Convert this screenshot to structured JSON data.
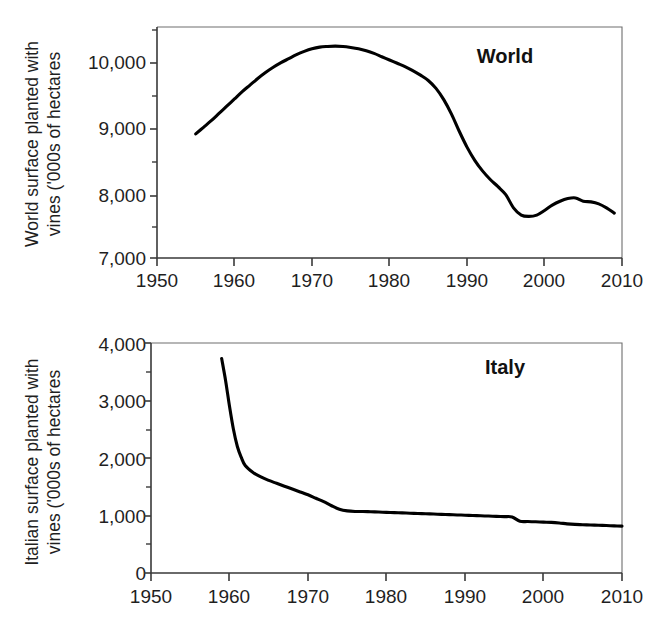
{
  "figure": {
    "background": "#ffffff",
    "line_color": "#000000",
    "axis_color": "#3a3a3a"
  },
  "chart_data": [
    {
      "type": "line",
      "panel_id": "world",
      "title": "",
      "annotation": "World",
      "xlabel": "",
      "ylabel": "World surface planted with vines ('000s of hectares",
      "ylabel_line1": "World surface planted with",
      "ylabel_line2": "vines ('000s of hectares",
      "xlim": [
        1950,
        2010
      ],
      "ylim": [
        7000,
        10500
      ],
      "grid": false,
      "legend": "none",
      "xticks": [
        1950,
        1960,
        1970,
        1980,
        1990,
        2000,
        2010
      ],
      "xtick_labels": [
        "1950",
        "1960",
        "1970",
        "1980",
        "1990",
        "2000",
        "2010"
      ],
      "x_minor_step": 5,
      "yticks": [
        7000,
        8000,
        9000,
        10000
      ],
      "ytick_labels": [
        "7,000",
        "8,000",
        "9,000",
        "10,000"
      ],
      "y_minor_step": 500,
      "series": [
        {
          "name": "World surface planted with vines",
          "units": "'000s of hectares",
          "x": [
            1955,
            1956,
            1957,
            1958,
            1959,
            1960,
            1961,
            1962,
            1963,
            1964,
            1965,
            1966,
            1967,
            1968,
            1969,
            1970,
            1971,
            1972,
            1973,
            1974,
            1975,
            1976,
            1977,
            1978,
            1979,
            1980,
            1981,
            1982,
            1983,
            1984,
            1985,
            1986,
            1987,
            1988,
            1989,
            1990,
            1991,
            1992,
            1993,
            1994,
            1995,
            1996,
            1997,
            1998,
            1999,
            2000,
            2001,
            2002,
            2003,
            2004,
            2005,
            2006,
            2007,
            2008,
            2009
          ],
          "values": [
            8880,
            8980,
            9080,
            9190,
            9300,
            9410,
            9520,
            9620,
            9720,
            9810,
            9890,
            9960,
            10020,
            10080,
            10130,
            10170,
            10195,
            10205,
            10210,
            10205,
            10190,
            10170,
            10140,
            10100,
            10050,
            10000,
            9950,
            9900,
            9840,
            9770,
            9690,
            9570,
            9400,
            9180,
            8920,
            8680,
            8480,
            8320,
            8190,
            8080,
            7960,
            7760,
            7650,
            7630,
            7650,
            7720,
            7800,
            7860,
            7900,
            7910,
            7860,
            7850,
            7820,
            7760,
            7680
          ]
        }
      ]
    },
    {
      "type": "line",
      "panel_id": "italy",
      "title": "",
      "annotation": "Italy",
      "xlabel": "",
      "ylabel": "Italian surface planted with vines ('000s of hectares",
      "ylabel_line1": "Italian surface planted with",
      "ylabel_line2": "vines ('000s of hectares",
      "xlim": [
        1950,
        2010
      ],
      "ylim": [
        0,
        4000
      ],
      "grid": false,
      "legend": "none",
      "xticks": [
        1950,
        1960,
        1970,
        1980,
        1990,
        2000,
        2010
      ],
      "xtick_labels": [
        "1950",
        "1960",
        "1970",
        "1980",
        "1990",
        "2000",
        "2010"
      ],
      "x_minor_step": 5,
      "yticks": [
        0,
        1000,
        2000,
        3000,
        4000
      ],
      "ytick_labels": [
        "0",
        "1,000",
        "2,000",
        "3,000",
        "4,000"
      ],
      "y_minor_step": 500,
      "series": [
        {
          "name": "Italian surface planted with vines",
          "units": "'000s of hectares",
          "x": [
            1959,
            1959.5,
            1960,
            1960.5,
            1961,
            1961.5,
            1962,
            1963,
            1964,
            1965,
            1966,
            1967,
            1968,
            1969,
            1970,
            1971,
            1972,
            1973,
            1974,
            1975,
            1976,
            1977,
            1978,
            1979,
            1980,
            1981,
            1982,
            1983,
            1984,
            1985,
            1986,
            1987,
            1988,
            1989,
            1990,
            1991,
            1992,
            1993,
            1994,
            1995,
            1996,
            1997,
            1998,
            1999,
            2000,
            2001,
            2002,
            2003,
            2004,
            2005,
            2006,
            2007,
            2008,
            2009,
            2010
          ],
          "values": [
            3730,
            3350,
            2900,
            2500,
            2200,
            2010,
            1870,
            1750,
            1670,
            1610,
            1560,
            1510,
            1460,
            1410,
            1360,
            1300,
            1240,
            1170,
            1110,
            1080,
            1070,
            1070,
            1065,
            1060,
            1055,
            1050,
            1045,
            1040,
            1035,
            1030,
            1025,
            1020,
            1015,
            1010,
            1005,
            1000,
            995,
            990,
            985,
            980,
            975,
            900,
            895,
            890,
            885,
            880,
            870,
            855,
            845,
            840,
            835,
            830,
            825,
            820,
            815
          ]
        }
      ]
    }
  ]
}
